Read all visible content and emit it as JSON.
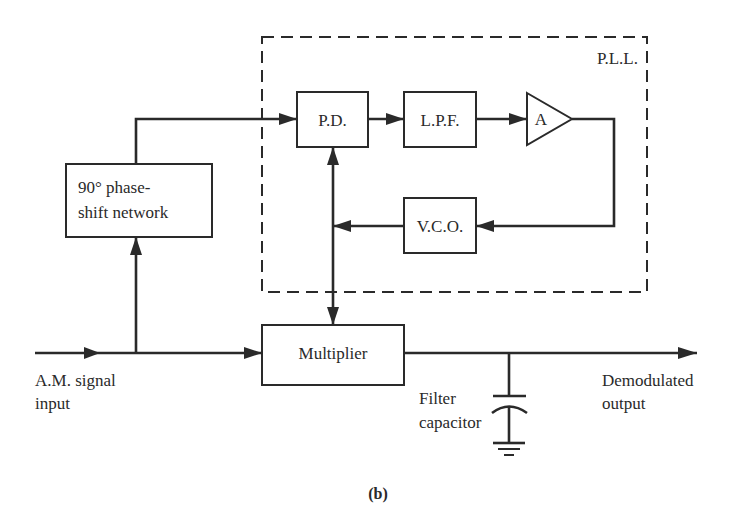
{
  "diagram": {
    "type": "block-diagram",
    "caption": "(b)",
    "group": {
      "label": "P.L.L.",
      "style": "dashed"
    },
    "blocks": {
      "pd": {
        "label": "P.D."
      },
      "lpf": {
        "label": "L.P.F."
      },
      "amp": {
        "label": "A",
        "shape": "triangle"
      },
      "vco": {
        "label": "V.C.O."
      },
      "phase_shift": {
        "line1": "90° phase-",
        "line2": "shift network"
      },
      "multiplier": {
        "label": "Multiplier"
      }
    },
    "labels": {
      "input_line1": "A.M. signal",
      "input_line2": "input",
      "output_line1": "Demodulated",
      "output_line2": "output",
      "capacitor_line1": "Filter",
      "capacitor_line2": "capacitor"
    },
    "connections": [
      {
        "from": "A.M. signal input",
        "to": "Multiplier"
      },
      {
        "from": "A.M. signal input",
        "to": "90° phase-shift network"
      },
      {
        "from": "90° phase-shift network",
        "to": "P.D."
      },
      {
        "from": "P.D.",
        "to": "L.P.F."
      },
      {
        "from": "L.P.F.",
        "to": "A"
      },
      {
        "from": "A",
        "to": "V.C.O."
      },
      {
        "from": "V.C.O.",
        "to": "P.D.",
        "bidirectional_with": "Multiplier"
      },
      {
        "from": "Multiplier",
        "to": "Demodulated output"
      },
      {
        "from": "Demodulated output line",
        "to": "Filter capacitor to ground"
      }
    ]
  }
}
